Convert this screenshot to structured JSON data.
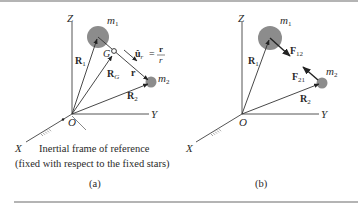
{
  "figure": {
    "panels": [
      {
        "id": "a",
        "caption": "(a)",
        "axes": {
          "z": "Z",
          "y": "Y",
          "x": "X",
          "origin": "O"
        },
        "masses": [
          {
            "label": "m",
            "sub": "1"
          },
          {
            "label": "m",
            "sub": "2"
          }
        ],
        "center_of_mass": "G",
        "vectors": [
          {
            "name": "R",
            "sub": "1"
          },
          {
            "name": "R",
            "sub": "G"
          },
          {
            "name": "R",
            "sub": "2"
          },
          {
            "name": "r"
          }
        ],
        "unit_vector": {
          "lhs": "û",
          "lhs_sub": "r",
          "eq": "=",
          "num": "r",
          "den": "r"
        },
        "note_line1": "Inertial frame of reference",
        "note_line2": "(fixed with respect to the fixed stars)"
      },
      {
        "id": "b",
        "caption": "(b)",
        "axes": {
          "z": "Z",
          "y": "Y",
          "x": "X",
          "origin": "O"
        },
        "masses": [
          {
            "label": "m",
            "sub": "1"
          },
          {
            "label": "m",
            "sub": "2"
          }
        ],
        "vectors": [
          {
            "name": "R",
            "sub": "1"
          },
          {
            "name": "R",
            "sub": "2"
          }
        ],
        "forces": [
          {
            "name": "F",
            "sub": "12"
          },
          {
            "name": "F",
            "sub": "21"
          }
        ]
      }
    ],
    "colors": {
      "mass_fill": "#8c8c8c",
      "line": "#333333",
      "text": "#2a2a2a",
      "rule": "#6a6a6a"
    }
  }
}
